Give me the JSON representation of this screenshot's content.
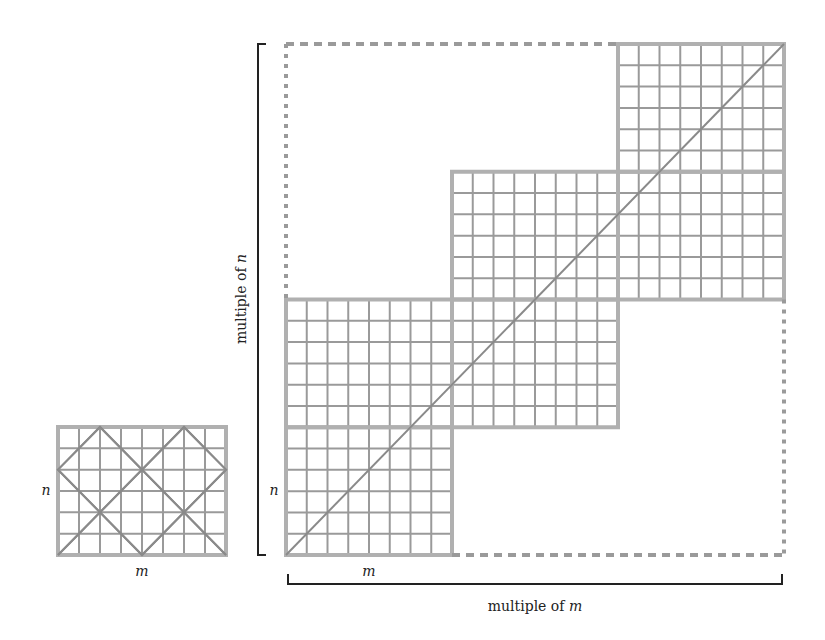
{
  "small_grid": {
    "cols": 8,
    "rows": 6,
    "label_n": "n",
    "label_m": "m"
  },
  "big_grid": {
    "block_cols": 8,
    "block_rows": 6,
    "blocks_across": 3,
    "blocks_down": 2,
    "label_n": "n",
    "label_m": "m"
  },
  "axis_labels": {
    "vertical_prefix": "multiple of ",
    "vertical_var": "n",
    "horizontal_prefix": "multiple of ",
    "horizontal_var": "m"
  },
  "colors": {
    "grid": "#9a9a9a",
    "border": "#b0b0b0",
    "diagonal": "#8a8a8a",
    "bracket": "#222222"
  }
}
